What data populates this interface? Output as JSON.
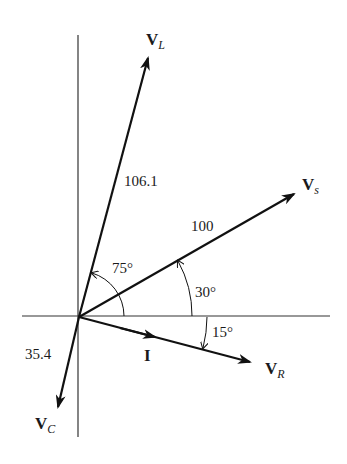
{
  "diagram": {
    "type": "phasor-diagram",
    "axes": {
      "horizontal": {
        "x1": 22,
        "x2": 330,
        "y": 316
      },
      "vertical": {
        "x": 78,
        "y1": 35,
        "y2": 437
      }
    },
    "origin": {
      "x": 79,
      "y": 317
    },
    "phasors": [
      {
        "id": "VL",
        "name": "V",
        "sub": "L",
        "magnitude_label": "106.1",
        "angle_deg": 75,
        "tip": {
          "x": 149,
          "y": 55
        }
      },
      {
        "id": "Vs",
        "name": "V",
        "sub": "s",
        "magnitude_label": "100",
        "angle_deg": 30,
        "tip": {
          "x": 297,
          "y": 192
        }
      },
      {
        "id": "VR",
        "name": "V",
        "sub": "R",
        "magnitude_label": "",
        "angle_deg": -15,
        "tip": {
          "x": 253,
          "y": 362
        }
      },
      {
        "id": "VC",
        "name": "V",
        "sub": "C",
        "magnitude_label": "35.4",
        "angle_deg": -105,
        "tip": {
          "x": 57,
          "y": 410
        }
      },
      {
        "id": "I",
        "name": "I",
        "sub": "",
        "magnitude_label": "",
        "angle_deg": -15,
        "tip": {
          "x": 155,
          "y": 336
        }
      }
    ],
    "labels": {
      "VL": {
        "main": "V",
        "sub": "L"
      },
      "Vs": {
        "main": "V",
        "sub": "s"
      },
      "VR": {
        "main": "V",
        "sub": "R"
      },
      "VC": {
        "main": "V",
        "sub": "C"
      },
      "I": {
        "main": "I"
      },
      "mag_VL": "106.1",
      "mag_Vs": "100",
      "mag_VC": "35.4"
    },
    "angles": {
      "a75": "75°",
      "a30": "30°",
      "a15": "15°"
    }
  }
}
